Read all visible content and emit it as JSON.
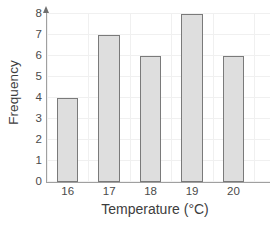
{
  "chart_data": {
    "type": "bar",
    "title": "",
    "subtitle": "",
    "xlabel": "Temperature (°C)",
    "ylabel": "Frequency",
    "categories": [
      "16",
      "17",
      "18",
      "19",
      "20"
    ],
    "values": [
      4,
      7,
      6,
      8,
      6
    ],
    "series": [
      {
        "name": "Frequency",
        "values": [
          4,
          7,
          6,
          8,
          6
        ]
      }
    ],
    "ylim": [
      0,
      8
    ],
    "y_ticks": [
      "0",
      "1",
      "2",
      "3",
      "4",
      "5",
      "6",
      "7",
      "8"
    ],
    "x_ticks": [
      "16",
      "17",
      "18",
      "19",
      "20"
    ],
    "grid": true,
    "grid_color": "#f0f0f0",
    "legend": false,
    "legend_position": "none",
    "bar_fill_color": "#dedede",
    "bar_border_color": "#7a7a7a",
    "axis_color": "#a0a0a0",
    "text_color": "#3d3d3d",
    "y_axis_arrow": true,
    "annotations": []
  }
}
